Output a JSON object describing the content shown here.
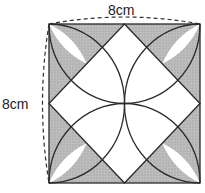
{
  "diagram": {
    "top_label": "8cm",
    "side_label": "8cm",
    "square_side_cm": 8,
    "colors": {
      "stroke": "#2a2a2a",
      "shade": "#b5b5b5",
      "background": "#ffffff"
    }
  }
}
